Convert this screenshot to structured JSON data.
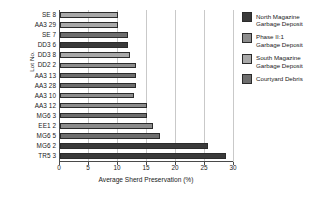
{
  "chart_data": {
    "type": "bar",
    "orientation": "horizontal",
    "title": "",
    "xlabel": "Average Sherd Preservation (%)",
    "ylabel": "Lot No.",
    "xlim": [
      0,
      30
    ],
    "xticks": [
      0,
      5,
      10,
      15,
      20,
      25,
      30
    ],
    "grid": true,
    "legend_position": "right",
    "categories": [
      "SE 8",
      "AA3 29",
      "SE 7",
      "DD3 6",
      "DD3 8",
      "DD2 2",
      "AA3 13",
      "AA3 28",
      "AA3 10",
      "AA3 12",
      "MG6 3",
      "EE1 2",
      "MG6 5",
      "MG6 2",
      "TR5 3"
    ],
    "values": [
      10.0,
      10.0,
      11.8,
      11.8,
      12.1,
      13.1,
      13.1,
      13.1,
      12.7,
      15.0,
      15.0,
      16.0,
      17.2,
      25.5,
      28.6
    ],
    "groups": [
      "South Magazine Garbage Deposit",
      "South Magazine Garbage Deposit",
      "Courtyard Debris",
      "North Magazine Garbage Deposit",
      "South Magazine Garbage Deposit",
      "Phase II:1 Garbage Deposit",
      "Courtyard Debris",
      "Courtyard Debris",
      "Phase II:1 Garbage Deposit",
      "Phase II:1 Garbage Deposit",
      "Courtyard Debris",
      "Phase II:1 Garbage Deposit",
      "Courtyard Debris",
      "North Magazine Garbage Deposit",
      "North Magazine Garbage Deposit"
    ],
    "bar_colors": [
      "#a8a8a8",
      "#a8a8a8",
      "#6e6e6e",
      "#3a3a3a",
      "#a8a8a8",
      "#8c8c8c",
      "#6e6e6e",
      "#6e6e6e",
      "#8c8c8c",
      "#8c8c8c",
      "#6e6e6e",
      "#8c8c8c",
      "#6e6e6e",
      "#3a3a3a",
      "#3a3a3a"
    ],
    "legend": [
      {
        "label": "North Magazine\nGarbage Deposit",
        "color": "#3a3a3a"
      },
      {
        "label": "Phase II:1\nGarbage Deposit",
        "color": "#8c8c8c"
      },
      {
        "label": "South Magazine\nGarbage Deposit",
        "color": "#a8a8a8"
      },
      {
        "label": "Courtyard Debris",
        "color": "#6e6e6e"
      }
    ]
  }
}
